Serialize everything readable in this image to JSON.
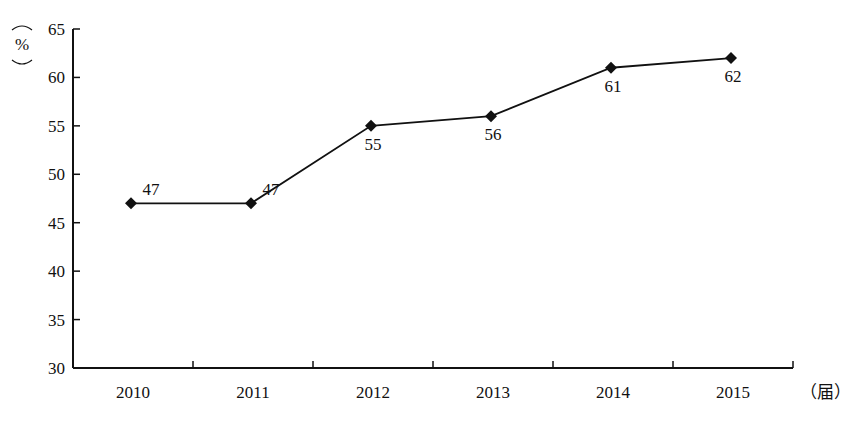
{
  "chart_data": {
    "type": "line",
    "title": "",
    "xlabel": "（届）",
    "ylabel": "（%）",
    "categories": [
      "2010",
      "2011",
      "2012",
      "2013",
      "2014",
      "2015"
    ],
    "series": [
      {
        "name": "",
        "values": [
          47,
          47,
          55,
          56,
          61,
          62
        ],
        "marker": "diamond",
        "color": "#000000"
      }
    ],
    "data_labels": [
      "47",
      "47",
      "55",
      "56",
      "61",
      "62"
    ],
    "ylim": [
      30,
      65
    ],
    "yticks": [
      "30",
      "35",
      "40",
      "45",
      "50",
      "55",
      "60",
      "65"
    ],
    "grid": false,
    "legend": null
  },
  "axis": {
    "y_unit_open": "(",
    "y_unit": "%",
    "y_unit_close": ")",
    "x_unit": "（届）"
  }
}
